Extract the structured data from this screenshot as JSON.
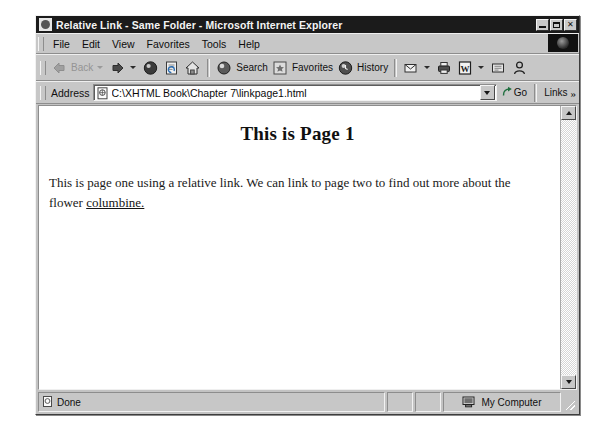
{
  "window": {
    "title": "Relative Link - Same Folder - Microsoft Internet Explorer",
    "title_icon": "ie-document-icon",
    "controls": {
      "minimize": "minimize-button",
      "maximize": "maximize-button",
      "close_label": "✕"
    }
  },
  "menu": {
    "items": [
      {
        "label": "File",
        "accel": "F"
      },
      {
        "label": "Edit",
        "accel": "E"
      },
      {
        "label": "View",
        "accel": "V"
      },
      {
        "label": "Favorites",
        "accel": "a"
      },
      {
        "label": "Tools",
        "accel": "T"
      },
      {
        "label": "Help",
        "accel": "H"
      }
    ],
    "logo": "ie-animated-logo"
  },
  "toolbar": {
    "back_label": "Back",
    "forward_label": "",
    "stop_label": "",
    "refresh_label": "",
    "home_label": "",
    "search_label": "Search",
    "favorites_label": "Favorites",
    "history_label": "History",
    "mail_label": "",
    "print_label": "",
    "edit_label": "",
    "discuss_label": "",
    "messenger_label": ""
  },
  "address": {
    "label": "Address",
    "value": "C:\\XHTML Book\\Chapter 7\\linkpage1.html",
    "placeholder": "",
    "go_label": "Go",
    "links_label": "Links",
    "links_chevron": "»"
  },
  "page": {
    "heading": "This is Page 1",
    "paragraph_before": "This is page one using a relative link. We can link to page two to find out more about the flower ",
    "link_text": "columbine.",
    "paragraph_after": ""
  },
  "status": {
    "text": "Done",
    "zone": "My Computer"
  },
  "colors": {
    "titlebar": "#1b1b1b",
    "chrome": "#c7c7c7",
    "page_bg": "#ffffff",
    "text": "#101010"
  }
}
